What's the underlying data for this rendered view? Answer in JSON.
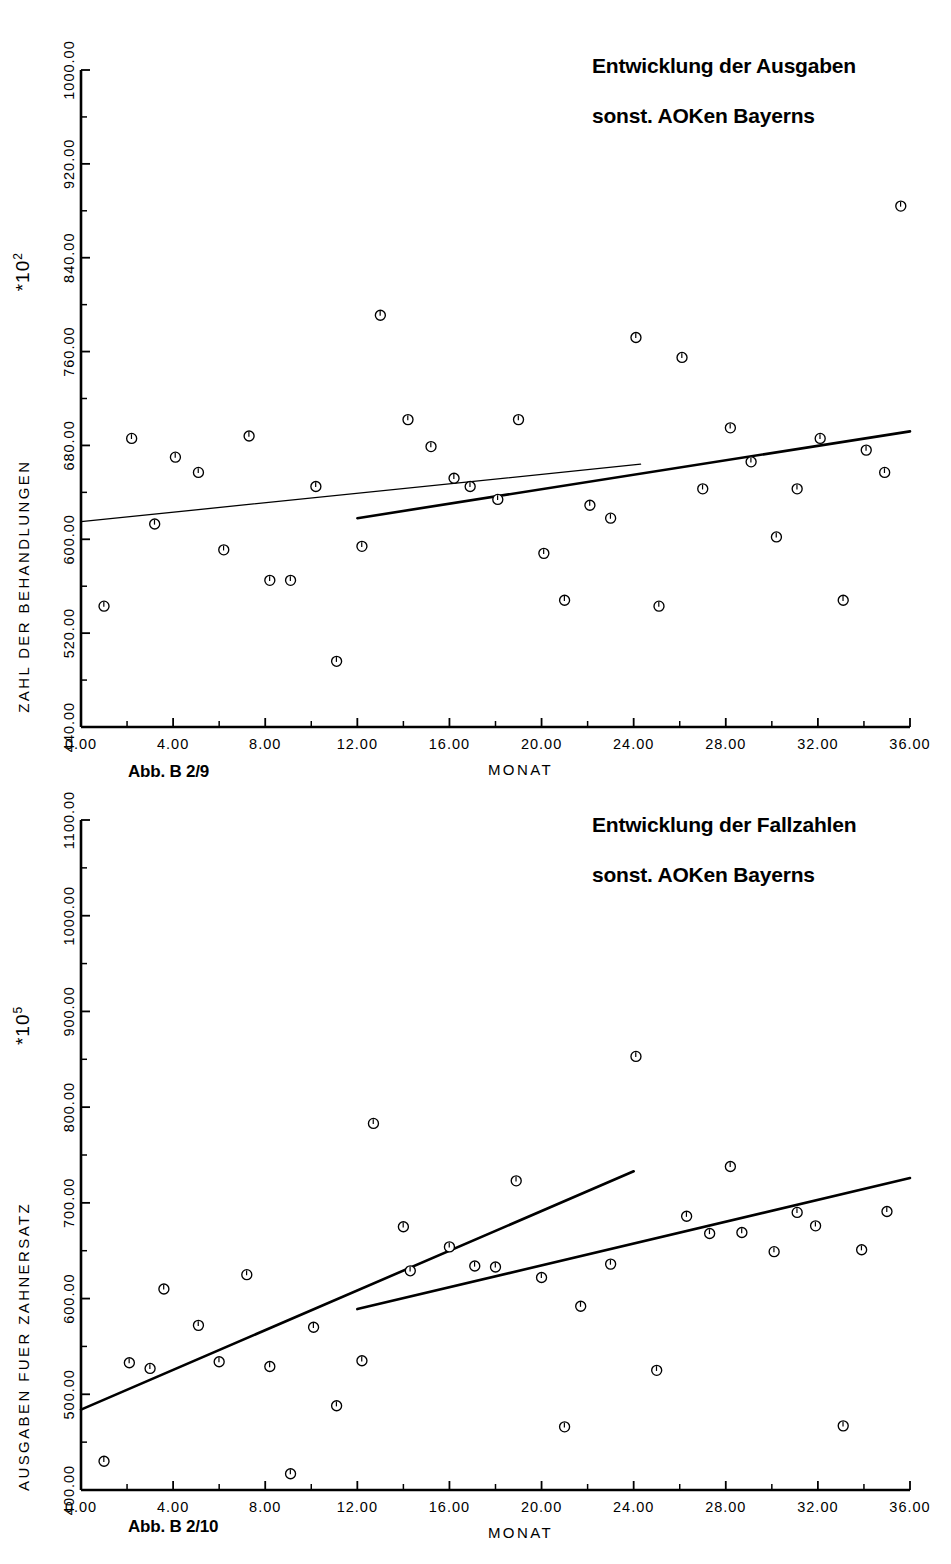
{
  "page": {
    "background": "#ffffff",
    "ink": "#000000"
  },
  "charts": [
    {
      "id": "chart-1",
      "figure_caption": "Abb. B 2/9",
      "title_line1": "Entwicklung der Ausgaben",
      "title_line2": "sonst. AOKen Bayerns",
      "y_axis_label": "ZAHL DER BEHANDLUNGEN",
      "x_axis_label": "MONAT",
      "y_multiplier_base": "*10",
      "y_multiplier_exp": "2",
      "x_ticks": [
        "0.00",
        "4.00",
        "8.00",
        "12.00",
        "16.00",
        "20.00",
        "24.00",
        "28.00",
        "32.00",
        "36.00"
      ],
      "y_ticks": [
        "440.00",
        "520.00",
        "600.00",
        "680.00",
        "760.00",
        "840.00",
        "920.00",
        "1000.00"
      ]
    },
    {
      "id": "chart-2",
      "figure_caption": "Abb. B 2/10",
      "title_line1": "Entwicklung der Fallzahlen",
      "title_line2": "sonst. AOKen Bayerns",
      "y_axis_label": "AUSGABEN FUER ZAHNERSATZ",
      "x_axis_label": "MONAT",
      "y_multiplier_base": "*10",
      "y_multiplier_exp": "5",
      "x_ticks": [
        "0.00",
        "4.00",
        "8.00",
        "12.00",
        "16.00",
        "20.00",
        "24.00",
        "28.00",
        "32.00",
        "36.00"
      ],
      "y_ticks": [
        "400.00",
        "500.00",
        "600.00",
        "700.00",
        "800.00",
        "900.00",
        "1000.00",
        "1100.00"
      ]
    }
  ],
  "chart_data": [
    {
      "type": "scatter",
      "title": "Entwicklung der Ausgaben sonst. AOKen Bayerns",
      "figure": "Abb. B 2/9",
      "xlabel": "MONAT",
      "ylabel": "ZAHL DER BEHANDLUNGEN",
      "y_multiplier": "*10^2",
      "xlim": [
        0,
        36
      ],
      "ylim": [
        440,
        1000
      ],
      "xticks": [
        0,
        4,
        8,
        12,
        16,
        20,
        24,
        28,
        32,
        36
      ],
      "yticks": [
        440,
        520,
        600,
        680,
        760,
        840,
        920,
        1000
      ],
      "grid": false,
      "legend": "none",
      "marker": "circle-open",
      "points": [
        {
          "x": 1.0,
          "y": 543
        },
        {
          "x": 2.2,
          "y": 686
        },
        {
          "x": 3.2,
          "y": 613
        },
        {
          "x": 4.1,
          "y": 670
        },
        {
          "x": 5.1,
          "y": 657
        },
        {
          "x": 6.2,
          "y": 591
        },
        {
          "x": 7.3,
          "y": 688
        },
        {
          "x": 8.2,
          "y": 565
        },
        {
          "x": 9.1,
          "y": 565
        },
        {
          "x": 10.2,
          "y": 645
        },
        {
          "x": 11.1,
          "y": 496
        },
        {
          "x": 12.2,
          "y": 594
        },
        {
          "x": 13.0,
          "y": 791
        },
        {
          "x": 14.2,
          "y": 702
        },
        {
          "x": 15.2,
          "y": 679
        },
        {
          "x": 16.2,
          "y": 652
        },
        {
          "x": 16.9,
          "y": 645
        },
        {
          "x": 18.1,
          "y": 634
        },
        {
          "x": 19.0,
          "y": 702
        },
        {
          "x": 20.1,
          "y": 588
        },
        {
          "x": 21.0,
          "y": 548
        },
        {
          "x": 22.1,
          "y": 629
        },
        {
          "x": 23.0,
          "y": 618
        },
        {
          "x": 24.1,
          "y": 772
        },
        {
          "x": 25.1,
          "y": 543
        },
        {
          "x": 26.1,
          "y": 755
        },
        {
          "x": 27.0,
          "y": 643
        },
        {
          "x": 28.2,
          "y": 695
        },
        {
          "x": 29.1,
          "y": 666
        },
        {
          "x": 30.2,
          "y": 602
        },
        {
          "x": 31.1,
          "y": 643
        },
        {
          "x": 32.1,
          "y": 686
        },
        {
          "x": 33.1,
          "y": 548
        },
        {
          "x": 34.1,
          "y": 676
        },
        {
          "x": 34.9,
          "y": 657
        },
        {
          "x": 35.6,
          "y": 884
        }
      ],
      "trend_lines": [
        {
          "name": "full-range-trend",
          "x": [
            0,
            24.3
          ],
          "y": [
            615,
            664
          ],
          "weight": "thin"
        },
        {
          "name": "second-period-trend",
          "x": [
            12.0,
            36.0
          ],
          "y": [
            618,
            692
          ],
          "weight": "thick"
        }
      ]
    },
    {
      "type": "scatter",
      "title": "Entwicklung der Fallzahlen sonst. AOKen Bayerns",
      "figure": "Abb. B 2/10",
      "xlabel": "MONAT",
      "ylabel": "AUSGABEN FUER ZAHNERSATZ",
      "y_multiplier": "*10^5",
      "xlim": [
        0,
        36
      ],
      "ylim": [
        400,
        1100
      ],
      "xticks": [
        0,
        4,
        8,
        12,
        16,
        20,
        24,
        28,
        32,
        36
      ],
      "yticks": [
        400,
        500,
        600,
        700,
        800,
        900,
        1000,
        1100
      ],
      "grid": false,
      "legend": "none",
      "marker": "circle-open",
      "points": [
        {
          "x": 1.0,
          "y": 430
        },
        {
          "x": 2.1,
          "y": 533
        },
        {
          "x": 3.0,
          "y": 527
        },
        {
          "x": 3.6,
          "y": 610
        },
        {
          "x": 5.1,
          "y": 572
        },
        {
          "x": 6.0,
          "y": 534
        },
        {
          "x": 7.2,
          "y": 625
        },
        {
          "x": 8.2,
          "y": 529
        },
        {
          "x": 9.1,
          "y": 417
        },
        {
          "x": 10.1,
          "y": 570
        },
        {
          "x": 11.1,
          "y": 488
        },
        {
          "x": 12.2,
          "y": 535
        },
        {
          "x": 12.7,
          "y": 783
        },
        {
          "x": 14.0,
          "y": 675
        },
        {
          "x": 14.3,
          "y": 629
        },
        {
          "x": 16.0,
          "y": 654
        },
        {
          "x": 17.1,
          "y": 634
        },
        {
          "x": 18.0,
          "y": 633
        },
        {
          "x": 18.9,
          "y": 723
        },
        {
          "x": 20.0,
          "y": 622
        },
        {
          "x": 21.0,
          "y": 466
        },
        {
          "x": 21.7,
          "y": 592
        },
        {
          "x": 23.0,
          "y": 636
        },
        {
          "x": 24.1,
          "y": 853
        },
        {
          "x": 25.0,
          "y": 525
        },
        {
          "x": 26.3,
          "y": 686
        },
        {
          "x": 27.3,
          "y": 668
        },
        {
          "x": 28.2,
          "y": 738
        },
        {
          "x": 28.7,
          "y": 669
        },
        {
          "x": 30.1,
          "y": 649
        },
        {
          "x": 31.1,
          "y": 690
        },
        {
          "x": 31.9,
          "y": 676
        },
        {
          "x": 33.1,
          "y": 467
        },
        {
          "x": 33.9,
          "y": 651
        },
        {
          "x": 35.0,
          "y": 691
        }
      ],
      "trend_lines": [
        {
          "name": "full-range-trend",
          "x": [
            0,
            24.0
          ],
          "y": [
            484,
            733
          ],
          "weight": "thick"
        },
        {
          "name": "second-period-trend",
          "x": [
            12.0,
            36.0
          ],
          "y": [
            589,
            726
          ],
          "weight": "thick"
        }
      ]
    }
  ]
}
